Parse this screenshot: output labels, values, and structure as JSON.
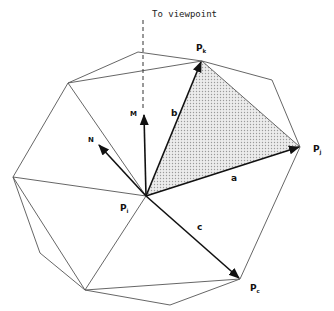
{
  "diagram": {
    "title_annotation": "To viewpoint",
    "points": {
      "center": {
        "label": "P",
        "sub": "i",
        "x": 146,
        "y": 196
      },
      "pk": {
        "label": "P",
        "sub": "k",
        "x": 202,
        "y": 61
      },
      "pj": {
        "label": "P",
        "sub": "j",
        "x": 300,
        "y": 147
      },
      "pc": {
        "label": "P",
        "sub": "c",
        "x": 240,
        "y": 279
      }
    },
    "vectors": {
      "a": "a",
      "b": "b",
      "c": "c",
      "M": "M",
      "N": "N"
    },
    "colors": {
      "line": "#555555",
      "vector": "#111111",
      "shaded_triangle": "#d9d9d9"
    }
  }
}
